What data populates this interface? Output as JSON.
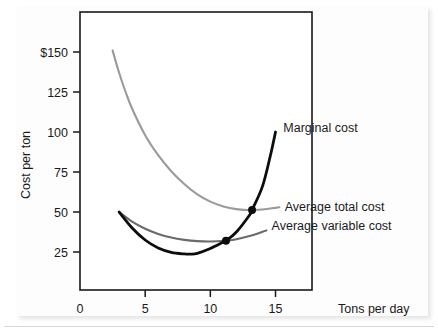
{
  "figure": {
    "kind": "line-chart",
    "background_color": "#ffffff",
    "panel_color": "#fdfdfd"
  },
  "chart_data": {
    "type": "line",
    "title": "",
    "subtitle": "",
    "xlabel": "Tons per day",
    "ylabel": "Cost per ton",
    "xlim": [
      0,
      17.8
    ],
    "ylim": [
      0,
      175
    ],
    "grid": false,
    "legend_position": "inline-right-of-curve-ends",
    "x_ticks": [
      0,
      5,
      10,
      15
    ],
    "x_tick_labels": [
      "0",
      "5",
      "10",
      "15"
    ],
    "y_ticks": [
      25,
      50,
      75,
      100,
      125,
      150
    ],
    "y_tick_labels": [
      "25",
      "50",
      "75",
      "100",
      "125",
      "$150"
    ],
    "currency_symbol": "$",
    "series": [
      {
        "name": "Average total cost",
        "label": "Average total cost",
        "color": "#9a9a9a",
        "line_width": 2.1,
        "x": [
          2.5,
          3.0,
          3.5,
          4.0,
          5.0,
          6.0,
          7.0,
          8.0,
          9.0,
          10.0,
          11.0,
          12.0,
          13.0,
          13.2,
          14.0,
          15.0,
          15.3
        ],
        "y": [
          151.0,
          137.0,
          125.0,
          114.5,
          98.0,
          85.5,
          75.5,
          67.5,
          61.0,
          56.5,
          53.5,
          51.8,
          51.2,
          51.2,
          51.6,
          52.6,
          53.0
        ]
      },
      {
        "name": "Average variable cost",
        "label": "Average variable cost",
        "color": "#6a6a6a",
        "line_width": 2.1,
        "x": [
          3.0,
          4.0,
          5.0,
          6.0,
          7.0,
          8.0,
          9.0,
          10.0,
          11.0,
          11.2,
          12.0,
          13.0,
          14.0,
          14.3
        ],
        "y": [
          50.0,
          44.0,
          39.5,
          36.3,
          34.0,
          32.6,
          31.8,
          31.6,
          31.9,
          32.0,
          33.0,
          35.0,
          37.6,
          38.5
        ]
      },
      {
        "name": "Marginal cost",
        "label": "Marginal cost",
        "color": "#0d0d0d",
        "line_width": 2.8,
        "x": [
          3.0,
          4.0,
          5.0,
          6.0,
          7.0,
          8.0,
          8.5,
          9.0,
          10.0,
          11.0,
          11.2,
          12.0,
          13.0,
          13.2,
          14.0,
          14.6,
          15.0
        ],
        "y": [
          50.0,
          40.0,
          32.5,
          27.5,
          24.8,
          23.8,
          23.7,
          24.2,
          27.2,
          31.2,
          32.0,
          37.5,
          48.0,
          51.2,
          66.0,
          85.0,
          100.0
        ]
      }
    ],
    "intersection_points": [
      {
        "name": "mc-crosses-avc-minimum",
        "x": 11.2,
        "y": 32.0,
        "color": "#0d0d0d",
        "radius": 4.0
      },
      {
        "name": "mc-crosses-atc-minimum",
        "x": 13.2,
        "y": 51.2,
        "color": "#0d0d0d",
        "radius": 4.0
      }
    ],
    "annotations": [
      {
        "name": "marginal-cost-label",
        "text": "Marginal cost",
        "x": 15.6,
        "y": 103.0
      },
      {
        "name": "average-total-cost-label",
        "text": "Average total cost",
        "x": 15.7,
        "y": 53.6
      },
      {
        "name": "average-variable-cost-label",
        "text": "Average variable cost",
        "x": 14.7,
        "y": 41.5
      }
    ]
  },
  "axes": {
    "y_axis_title": "Cost per ton",
    "x_axis_title": "Tons per day",
    "y_tick_labels": [
      "$150",
      "125",
      "100",
      "75",
      "50",
      "25"
    ],
    "x_tick_labels": [
      "0",
      "5",
      "10",
      "15"
    ]
  },
  "curves": {
    "marginal_cost": "Marginal cost",
    "average_total_cost": "Average total cost",
    "average_variable_cost": "Average variable cost"
  },
  "colors": {
    "marginal_cost": "#0d0d0d",
    "average_total_cost": "#9a9a9a",
    "average_variable_cost": "#6a6a6a",
    "frame": "#1a1a1a",
    "text": "#1a1a1a"
  }
}
